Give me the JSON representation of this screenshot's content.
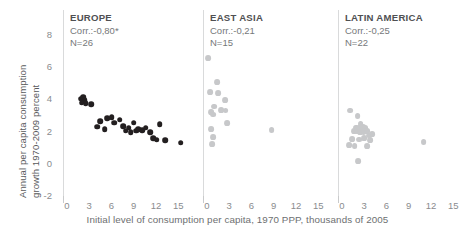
{
  "axes": {
    "ylabel_line1": "Annual per capita consumption",
    "ylabel_line2": "growth 1970-2009 percent",
    "xlabel": "Initial level of consumption per capita, 1970 PPP, thousands of 2005",
    "yticks": [
      "8",
      "6",
      "4",
      "2",
      "0",
      "-2"
    ],
    "xticks": [
      "0",
      "3",
      "6",
      "9",
      "12",
      "15"
    ]
  },
  "chart_data": {
    "type": "scatter",
    "title": "",
    "subtitle": "",
    "xlabel": "Initial level of consumption per capita, 1970 PPP, thousands of 2005",
    "ylabel": "Annual per capita consumption growth 1970-2009 percent",
    "xlim": [
      -1.2,
      17.5
    ],
    "ylim": [
      -3.0,
      9.0
    ],
    "xticks": [
      0,
      3,
      6,
      9,
      12,
      15
    ],
    "yticks": [
      -2,
      0,
      2,
      4,
      6,
      8
    ],
    "grid": false,
    "legend": null,
    "panels": [
      {
        "name": "EUROPE",
        "title": "EUROPE",
        "corr_label": "Corr.:-0,80*",
        "corr": -0.8,
        "significant": true,
        "n_label": "N=26",
        "n": 26,
        "color": "#231f20",
        "points": [
          [
            1.9,
            4.05
          ],
          [
            2.2,
            4.15
          ],
          [
            2.4,
            3.95
          ],
          [
            2.0,
            3.8
          ],
          [
            2.5,
            3.75
          ],
          [
            3.3,
            3.7
          ],
          [
            4.1,
            2.3
          ],
          [
            4.5,
            2.65
          ],
          [
            5.1,
            2.15
          ],
          [
            5.4,
            2.85
          ],
          [
            6.0,
            2.9
          ],
          [
            6.4,
            2.55
          ],
          [
            7.1,
            2.75
          ],
          [
            7.6,
            2.35
          ],
          [
            7.9,
            2.05
          ],
          [
            8.3,
            2.25
          ],
          [
            8.6,
            1.95
          ],
          [
            9.0,
            2.55
          ],
          [
            9.3,
            2.05
          ],
          [
            9.6,
            2.15
          ],
          [
            10.1,
            2.1
          ],
          [
            10.6,
            2.25
          ],
          [
            11.2,
            1.95
          ],
          [
            11.6,
            1.6
          ],
          [
            12.1,
            1.5
          ],
          [
            12.5,
            2.45
          ],
          [
            13.2,
            1.45
          ],
          [
            15.3,
            1.3
          ]
        ]
      },
      {
        "name": "EAST ASIA",
        "title": "EAST ASIA",
        "corr_label": "Corr.:-0,21",
        "corr": -0.21,
        "significant": false,
        "n_label": "N=15",
        "n": 15,
        "color": "#c7c8ca",
        "points": [
          [
            0.2,
            6.55
          ],
          [
            1.4,
            5.05
          ],
          [
            0.4,
            4.45
          ],
          [
            1.5,
            4.4
          ],
          [
            2.4,
            3.95
          ],
          [
            1.0,
            3.55
          ],
          [
            0.6,
            3.2
          ],
          [
            0.8,
            3.05
          ],
          [
            1.9,
            3.35
          ],
          [
            2.5,
            3.3
          ],
          [
            2.7,
            2.55
          ],
          [
            0.6,
            2.15
          ],
          [
            0.8,
            1.65
          ],
          [
            0.7,
            1.2
          ],
          [
            8.7,
            2.1
          ]
        ]
      },
      {
        "name": "LATIN AMERICA",
        "title": "LATIN AMERICA",
        "corr_label": "Corr.:-0,25",
        "corr": -0.25,
        "significant": false,
        "n_label": "N=22",
        "n": 22,
        "color": "#c7c8ca",
        "points": [
          [
            1.1,
            3.3
          ],
          [
            2.1,
            2.95
          ],
          [
            2.5,
            2.45
          ],
          [
            1.9,
            2.25
          ],
          [
            2.3,
            2.2
          ],
          [
            2.8,
            2.3
          ],
          [
            3.1,
            2.2
          ],
          [
            1.6,
            2.05
          ],
          [
            2.0,
            2.0
          ],
          [
            2.4,
            1.95
          ],
          [
            2.9,
            1.95
          ],
          [
            3.4,
            2.05
          ],
          [
            3.6,
            1.75
          ],
          [
            4.1,
            1.85
          ],
          [
            1.4,
            1.55
          ],
          [
            2.3,
            1.5
          ],
          [
            3.0,
            1.6
          ],
          [
            3.8,
            1.45
          ],
          [
            1.0,
            1.15
          ],
          [
            1.7,
            1.1
          ],
          [
            3.4,
            1.1
          ],
          [
            2.2,
            0.15
          ],
          [
            11.0,
            1.35
          ]
        ]
      }
    ]
  }
}
